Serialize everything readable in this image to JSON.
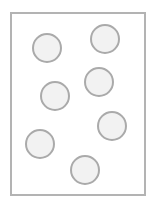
{
  "canvas": {
    "width": 154,
    "height": 207,
    "background": "#ffffff"
  },
  "frame": {
    "left": 10,
    "top": 12,
    "right": 146,
    "bottom": 196,
    "border_color": "#b3b3b3",
    "border_width": 2
  },
  "circles": {
    "fill": "#f2f2f2",
    "stroke": "#aaaaaa",
    "stroke_width": 2,
    "diameter": 30,
    "items": [
      {
        "cx": 47,
        "cy": 48
      },
      {
        "cx": 105,
        "cy": 39
      },
      {
        "cx": 99,
        "cy": 82
      },
      {
        "cx": 55,
        "cy": 96
      },
      {
        "cx": 112,
        "cy": 126
      },
      {
        "cx": 40,
        "cy": 144
      },
      {
        "cx": 85,
        "cy": 170
      }
    ],
    "count": 7
  }
}
